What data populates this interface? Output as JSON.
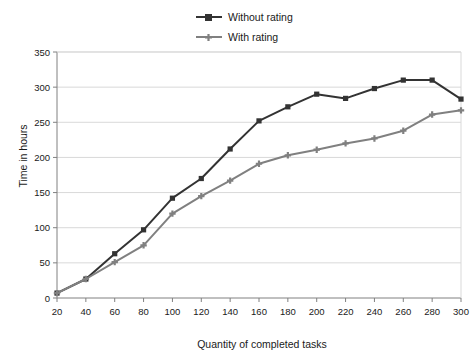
{
  "chart_data": {
    "type": "line",
    "title": "",
    "xlabel": "Quantity of completed tasks",
    "ylabel": "Time in hours",
    "x": [
      20,
      40,
      60,
      80,
      100,
      120,
      140,
      160,
      180,
      200,
      220,
      240,
      260,
      280,
      300
    ],
    "xlim": [
      20,
      300
    ],
    "ylim": [
      0,
      350
    ],
    "xticks": [
      "20",
      "40",
      "60",
      "80",
      "100",
      "120",
      "140",
      "160",
      "180",
      "200",
      "220",
      "240",
      "260",
      "280",
      "300"
    ],
    "yticks": [
      "0",
      "50",
      "100",
      "150",
      "200",
      "250",
      "300",
      "350"
    ],
    "grid": true,
    "legend_position": "top-center",
    "series": [
      {
        "name": "Without rating",
        "color": "#333333",
        "marker": "square",
        "values": [
          7,
          27,
          63,
          97,
          142,
          170,
          212,
          252,
          272,
          290,
          284,
          298,
          310,
          310,
          283
        ]
      },
      {
        "name": "With rating",
        "color": "#808080",
        "marker": "cross",
        "values": [
          7,
          27,
          51,
          75,
          120,
          145,
          167,
          191,
          203,
          211,
          220,
          227,
          238,
          261,
          267
        ]
      }
    ]
  },
  "colors": {
    "series_without_rating": "#333333",
    "series_with_rating": "#808080",
    "grid": "#d9d9d9",
    "axis": "#808080",
    "text": "#1a1a1a",
    "background": "#ffffff"
  }
}
